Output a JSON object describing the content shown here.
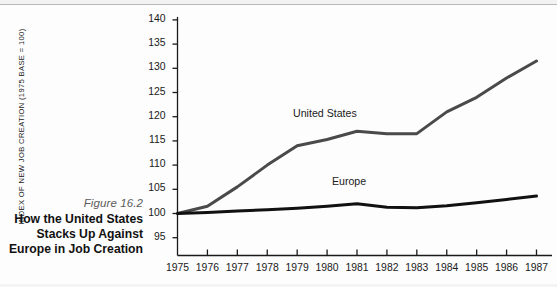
{
  "caption": {
    "figure_number": "Figure 16.2",
    "title_lines": [
      "How the United States",
      "Stacks Up Against",
      "Europe in Job Creation"
    ]
  },
  "chart_data": {
    "type": "line",
    "title": "",
    "xlabel": "",
    "ylabel": "INDEX OF NEW JOB CREATION (1975 BASE = 100)",
    "x": [
      1975,
      1976,
      1977,
      1978,
      1979,
      1980,
      1981,
      1982,
      1983,
      1984,
      1985,
      1986,
      1987
    ],
    "xtick_labels": [
      "1975",
      "1976",
      "1977",
      "1978",
      "1979",
      "1980",
      "1981",
      "1982",
      "1983",
      "1984",
      "1985",
      "1986",
      "1987"
    ],
    "ytick_labels": [
      "95",
      "100",
      "105",
      "110",
      "115",
      "120",
      "125",
      "130",
      "135",
      "140"
    ],
    "yticks": [
      95,
      100,
      105,
      110,
      115,
      120,
      125,
      130,
      135,
      140
    ],
    "ylim": [
      91.5,
      141
    ],
    "xlim": [
      1975,
      1987
    ],
    "grid": false,
    "legend_position": "inline-annotation",
    "series": [
      {
        "name": "United States",
        "color": "#4a4a4a",
        "values": [
          100.0,
          101.5,
          105.5,
          110.0,
          114.0,
          115.3,
          117.0,
          116.5,
          116.5,
          121.0,
          124.0,
          128.0,
          131.5
        ],
        "label_x": 1980,
        "label_y": 120.5
      },
      {
        "name": "Europe",
        "color": "#111111",
        "values": [
          100.0,
          100.2,
          100.5,
          100.8,
          101.1,
          101.5,
          102.0,
          101.3,
          101.2,
          101.6,
          102.2,
          102.9,
          103.6
        ],
        "label_x": 1981.3,
        "label_y": 106.6
      }
    ],
    "annotations": [
      {
        "text": "United States",
        "x": 1980,
        "y": 120.5
      },
      {
        "text": "Europe",
        "x": 1981.3,
        "y": 106.6
      }
    ]
  }
}
